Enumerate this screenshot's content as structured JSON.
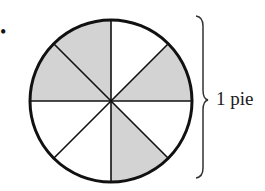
{
  "diagram": {
    "type": "fraction-pie",
    "total_slices": 8,
    "shaded_slices": 4,
    "slices": [
      {
        "index": 0,
        "from_deg": 0,
        "to_deg": 45,
        "shaded": false
      },
      {
        "index": 1,
        "from_deg": 45,
        "to_deg": 90,
        "shaded": true
      },
      {
        "index": 2,
        "from_deg": 90,
        "to_deg": 135,
        "shaded": false
      },
      {
        "index": 3,
        "from_deg": 135,
        "to_deg": 180,
        "shaded": true
      },
      {
        "index": 4,
        "from_deg": 180,
        "to_deg": 225,
        "shaded": false
      },
      {
        "index": 5,
        "from_deg": 225,
        "to_deg": 270,
        "shaded": false
      },
      {
        "index": 6,
        "from_deg": 270,
        "to_deg": 315,
        "shaded": true
      },
      {
        "index": 7,
        "from_deg": 315,
        "to_deg": 360,
        "shaded": true
      }
    ],
    "colors": {
      "shaded": "#d3d3d3",
      "unshaded": "#ffffff",
      "stroke": "#111111"
    },
    "brace_label": "1 pie",
    "bullet": "•"
  }
}
